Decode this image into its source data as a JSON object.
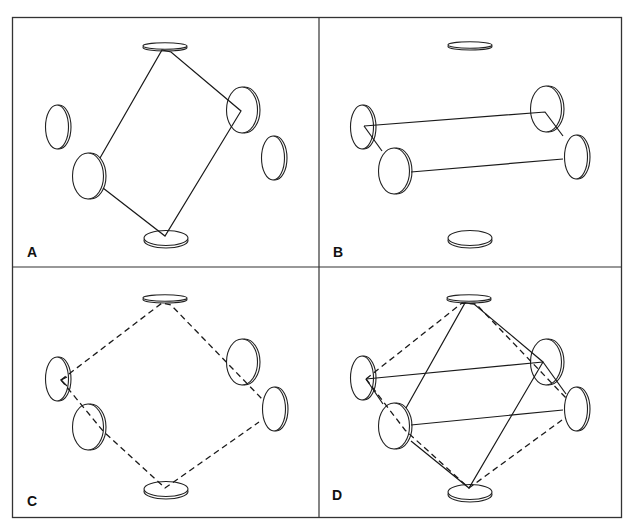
{
  "figure": {
    "panels": [
      {
        "id": "A",
        "label": "A",
        "beam_path": "solid rhombus through top, right-near, bottom, left-near mirrors"
      },
      {
        "id": "B",
        "label": "B",
        "beam_path": "solid horizontal-ish loop through left-far, left-near, right-far, right-near mirrors"
      },
      {
        "id": "C",
        "label": "C",
        "beam_path": "dashed rhombus through top, right-far, bottom, left-far mirrors"
      },
      {
        "id": "D",
        "label": "D",
        "beam_path": "superposition of solid and dashed paths through all six mirrors"
      }
    ]
  }
}
